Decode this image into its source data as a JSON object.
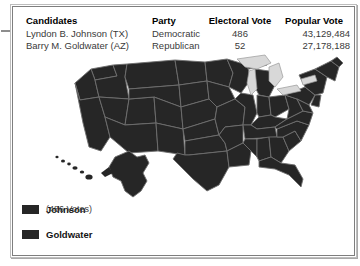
{
  "colors": {
    "johnson_fill": "#262626",
    "goldwater_fill": "#262626",
    "state_border": "#6e6e6e",
    "lakes": "#d8d8d8",
    "panel_border": "#7e7e7e",
    "text": "#1c1c1c",
    "text_muted": "#3a3a3a"
  },
  "table": {
    "headers": {
      "candidates": "Candidates",
      "party": "Party",
      "electoral_vote": "Electoral Vote",
      "popular_vote": "Popular Vote"
    },
    "rows": [
      {
        "candidate": "Lyndon B. Johnson (TX)",
        "party": "Democratic",
        "electoral_vote": "486",
        "popular_vote": "43,129,484"
      },
      {
        "candidate": "Barry M. Goldwater (AZ)",
        "party": "Republican",
        "electoral_vote": "52",
        "popular_vote": "27,178,188"
      }
    ]
  },
  "legend": {
    "johnson": {
      "label": "Johnson",
      "votes": "(486 Votes)",
      "swatch_name": "johnson-swatch"
    },
    "goldwater": {
      "label": "Goldwater",
      "swatch_name": "goldwater-swatch"
    }
  },
  "map": {
    "name": "united-states-electoral-map",
    "lakes_label": "Great Lakes",
    "insets": [
      "Alaska",
      "Hawaii"
    ]
  }
}
